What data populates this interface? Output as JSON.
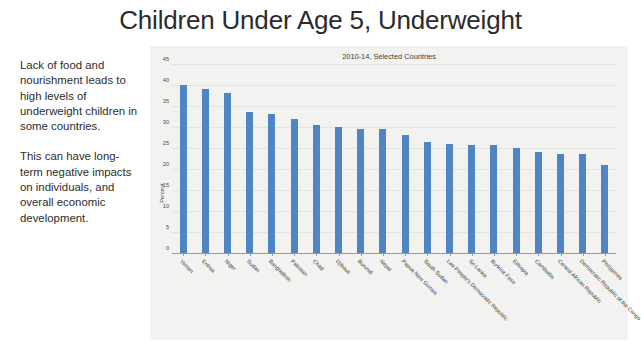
{
  "slide": {
    "title": "Children Under Age 5, Underweight",
    "narrative": [
      "Lack of food and nourishment leads to high levels of underweight children in some countries.",
      "This can have long-term negative impacts on individuals, and overall economic development."
    ]
  },
  "colors": {
    "bar": "#4f85c5",
    "panel_background": "#f2f2f0",
    "gridline": "#e2e2de",
    "axis": "#9a9a96",
    "title_text": "#2b2b2b"
  },
  "chart_data": {
    "type": "bar",
    "title": "2010-14, Selected Countries",
    "xlabel": "",
    "ylabel": "Percent",
    "ylim": [
      0,
      45
    ],
    "yticks": [
      0,
      5,
      10,
      15,
      20,
      25,
      30,
      35,
      40,
      45
    ],
    "grid": true,
    "legend": "none",
    "categories": [
      "Yemen",
      "Eritrea",
      "Niger",
      "Sudan",
      "Bangladesh",
      "Pakistan",
      "Chad",
      "Djibouti",
      "Burundi",
      "Nepal",
      "Papua New Guinea",
      "South Sudan",
      "Lao People's Democratic Republic",
      "Sri Lanka",
      "Burkina Faso",
      "Ethiopia",
      "Cambodia",
      "Central African Republic",
      "Democratic Republic of the Congo",
      "Philippines"
    ],
    "values": [
      40,
      39,
      38,
      33.5,
      33,
      32,
      30.5,
      30,
      29.5,
      29.5,
      28,
      26.5,
      26,
      25.8,
      25.7,
      25,
      24,
      23.5,
      23.5,
      21
    ]
  }
}
